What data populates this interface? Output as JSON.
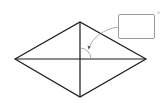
{
  "diagram": {
    "type": "rhombus-with-diagonals",
    "vertices": {
      "left": [
        15,
        59
      ],
      "top": [
        80,
        22
      ],
      "right": [
        146,
        59
      ],
      "bottom": [
        80,
        97
      ]
    },
    "intersection": [
      80,
      59
    ],
    "angle_marker": {
      "radius": 11,
      "label": ""
    },
    "answer_box": {
      "value": "",
      "unit_symbol": "°"
    },
    "colors": {
      "stroke": "#1a1a1a",
      "annotation": "#8a8a8a"
    }
  }
}
